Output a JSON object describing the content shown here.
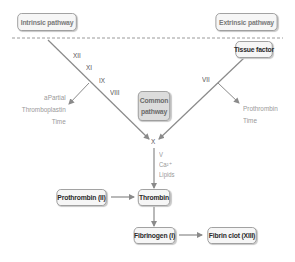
{
  "headers": {
    "intrinsic": "Intrinsic pathway",
    "extrinsic": "Extrinsic pathway"
  },
  "nodes": {
    "tissue_factor": "Tissue factor",
    "common_line1": "Common",
    "common_line2": "pathway",
    "x": "X",
    "prothrombin": "Prothrombin (II)",
    "thrombin": "Thrombin",
    "fibrinogen": "Fibrinogen (I)",
    "fibrin_clot": "Fibrin clot (XIII)"
  },
  "factors": {
    "intrinsic": [
      "XII",
      "XI",
      "IX",
      "VIII"
    ],
    "extrinsic": [
      "VII"
    ],
    "cofactors": [
      "V",
      "Ca²⁺",
      "Lipids"
    ]
  },
  "tests": {
    "aptt": [
      "aPartial",
      "Thromboplastin",
      "Time"
    ],
    "pt": [
      "Prothrombin",
      "Time"
    ]
  },
  "colors": {
    "line": "#8a8a8a",
    "box_border": "#9a9a9a",
    "box_fill": "#f6f6f6",
    "common_fill": "#dcdcdc"
  }
}
